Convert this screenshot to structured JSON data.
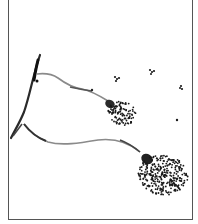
{
  "figure": {
    "colors": {
      "ink": "#1a1a1a",
      "stalk": "#8a8a8a",
      "paper": "#ffffff",
      "frame": "#555555"
    },
    "elements": {
      "main_hypha": "curved dark hypha on left side",
      "upper_conidiophore": "upper stalk ending in small spore head",
      "lower_conidiophore": "lower stalk ending in large spore head",
      "loose_spores": "scattered spore clusters in upper right"
    }
  }
}
